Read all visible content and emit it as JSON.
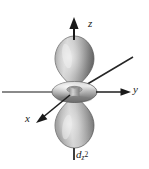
{
  "figure": {
    "background_color": "#ffffff",
    "caption": {
      "base": "d",
      "subscript": "z",
      "superscript": "2",
      "full_text": "dz2"
    }
  },
  "axes": [
    {
      "id": "z",
      "label": "z",
      "direction": "vertical-up",
      "arrow": true,
      "color": "#1a1a1a"
    },
    {
      "id": "y",
      "label": "y",
      "direction": "horizontal-right",
      "arrow": true,
      "color": "#6e6e6e"
    },
    {
      "id": "x",
      "label": "x",
      "direction": "diagonal-down-left",
      "arrow": true,
      "color": "#1a1a1a"
    }
  ],
  "orbital": {
    "type": "d-orbital",
    "name": "dz2",
    "lobes": [
      {
        "id": "upper-lobe",
        "shape": "teardrop",
        "orientation": "up-along-z"
      },
      {
        "id": "lower-lobe",
        "shape": "teardrop",
        "orientation": "down-along-z"
      }
    ],
    "torus": {
      "id": "central-torus",
      "shape": "donut",
      "plane": "xy"
    },
    "shading": {
      "highlight": "#e8e8e8",
      "midtone": "#a9a9a9",
      "shadow": "#6b6b6b",
      "outline": "#4a4a4a"
    }
  }
}
